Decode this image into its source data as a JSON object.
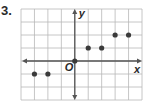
{
  "problem": {
    "number": "3."
  },
  "colors": {
    "grid": "#b8b8b8",
    "axis": "#555555",
    "point": "#3a3a3a",
    "text": "#2a2a2a"
  },
  "chart_data": {
    "type": "scatter",
    "title": "",
    "xlabel": "x",
    "ylabel": "y",
    "origin_label": "O",
    "xlim": [
      -4,
      5
    ],
    "ylim": [
      -3,
      4
    ],
    "grid": true,
    "axis_arrows": true,
    "tick_labels": false,
    "points": [
      {
        "x": -3,
        "y": -1
      },
      {
        "x": -2,
        "y": -1
      },
      {
        "x": 0,
        "y": 0
      },
      {
        "x": 1,
        "y": 1
      },
      {
        "x": 2,
        "y": 1
      },
      {
        "x": 3,
        "y": 2
      },
      {
        "x": 4,
        "y": 2
      }
    ]
  }
}
